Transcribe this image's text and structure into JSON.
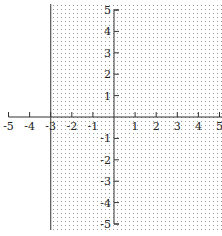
{
  "chart_data": {
    "type": "inequality-graph",
    "title": "",
    "xlabel": "",
    "ylabel": "",
    "xlim": [
      -5,
      5
    ],
    "ylim": [
      -5,
      5
    ],
    "x_ticks": [
      -5,
      -4,
      -3,
      -2,
      -1,
      1,
      2,
      3,
      4,
      5
    ],
    "y_ticks": [
      5,
      4,
      3,
      2,
      1,
      -1,
      -2,
      -3,
      -4,
      -5
    ],
    "x_tick_labels": [
      "-5",
      "-4",
      "-3",
      "-2",
      "-1",
      "1",
      "2",
      "3",
      "4",
      "5"
    ],
    "y_tick_labels": [
      "5",
      "4",
      "3",
      "2",
      "1",
      "-1",
      "-2",
      "-3",
      "-4",
      "-5"
    ],
    "grid": false,
    "boundary": {
      "type": "vertical-line",
      "x": -3,
      "style": "solid"
    },
    "shaded_region": {
      "description": "x >= -3",
      "side": "right",
      "pattern": "dotted"
    },
    "inequality": "x ≥ -3"
  },
  "colors": {
    "axis": "#333333",
    "boundary": "#555555",
    "shading_dot": "#9a9a9a",
    "background": "#ffffff"
  }
}
